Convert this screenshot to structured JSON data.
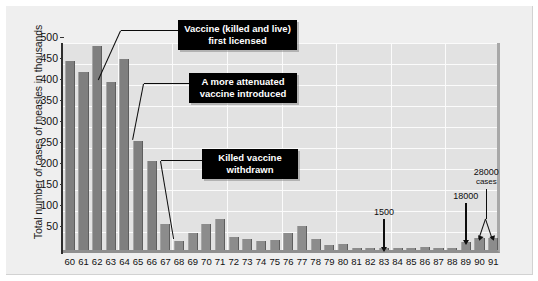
{
  "chart_data": {
    "type": "bar",
    "title": "",
    "xlabel": "",
    "ylabel": "Total number of cases of measles in thousands",
    "ylim": [
      0,
      500
    ],
    "yticks": [
      50,
      100,
      150,
      200,
      250,
      300,
      350,
      400,
      450,
      500
    ],
    "grid": true,
    "legend": "none",
    "categories": [
      "60",
      "61",
      "62",
      "63",
      "64",
      "65",
      "66",
      "67",
      "68",
      "69",
      "70",
      "71",
      "72",
      "73",
      "74",
      "75",
      "76",
      "77",
      "78",
      "79",
      "80",
      "81",
      "82",
      "83",
      "84",
      "85",
      "86",
      "87",
      "88",
      "89",
      "90",
      "91"
    ],
    "values": [
      450,
      425,
      485,
      400,
      455,
      260,
      212,
      62,
      22,
      40,
      62,
      75,
      32,
      27,
      22,
      24,
      41,
      57,
      27,
      13,
      14,
      3,
      2,
      1.5,
      3,
      3,
      6,
      4,
      3,
      18,
      28,
      28
    ],
    "annotations": [
      {
        "id": "vaccine-licensed",
        "text_line1": "Vaccine (killed and live)",
        "text_line2": "first licensed",
        "points_to": "63"
      },
      {
        "id": "attenuated-vaccine",
        "text_line1": "A more attenuated",
        "text_line2": "vaccine introduced",
        "points_to": "65"
      },
      {
        "id": "killed-vaccine-withdrawn",
        "text_line1": "Killed vaccine",
        "text_line2": "withdrawn",
        "points_to": "68"
      },
      {
        "id": "value-1983",
        "text": "1500",
        "sub": "",
        "points_to": "83"
      },
      {
        "id": "value-1989",
        "text": "18000",
        "sub": "",
        "points_to": "89"
      },
      {
        "id": "value-1990-91",
        "text": "28000",
        "sub": "cases",
        "points_to": "90,91"
      }
    ]
  },
  "colors": {
    "page_background": "#ffffff",
    "panel_background": "#efefef",
    "plot_background": "#e2e2e2",
    "gridline": "#fbfbfb",
    "bar_fill": "#8c8c8c",
    "axis_line": "#2e2e2e",
    "callout_background": "#000000",
    "callout_text": "#ffffff",
    "annotation_text": "#0d0d0d"
  }
}
